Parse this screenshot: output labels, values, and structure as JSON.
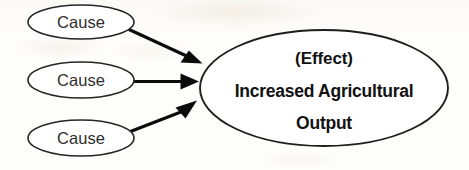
{
  "diagram": {
    "type": "cause-and-effect",
    "width": 469,
    "height": 170,
    "background_color": "#fdfdfb",
    "stroke_color": "#262626",
    "arrow_color": "#0b0b0b",
    "text_color": "#111111",
    "causes": [
      {
        "id": "cause-1",
        "label": "Cause",
        "cx": 81,
        "cy": 22,
        "rx": 53,
        "ry": 17
      },
      {
        "id": "cause-2",
        "label": "Cause",
        "cx": 81,
        "cy": 80,
        "rx": 53,
        "ry": 18
      },
      {
        "id": "cause-3",
        "label": "Cause",
        "cx": 81,
        "cy": 138,
        "rx": 53,
        "ry": 18
      }
    ],
    "effect": {
      "id": "effect-node",
      "cx": 324,
      "cy": 88,
      "rx": 124,
      "ry": 58,
      "lines": [
        "(Effect)",
        "Increased Agricultural",
        "Output"
      ]
    },
    "arrows": [
      {
        "id": "arrow-cause-1",
        "from": "cause-1",
        "to": "effect-node",
        "direction": "down-right"
      },
      {
        "id": "arrow-cause-2",
        "from": "cause-2",
        "to": "effect-node",
        "direction": "right"
      },
      {
        "id": "arrow-cause-3",
        "from": "cause-3",
        "to": "effect-node",
        "direction": "up-right"
      }
    ]
  }
}
